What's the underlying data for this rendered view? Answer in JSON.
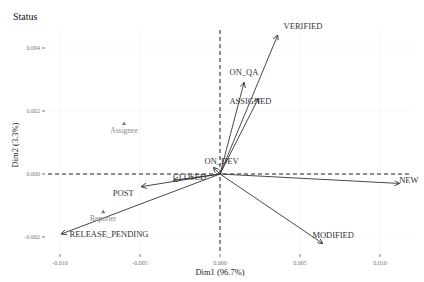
{
  "chart_data": {
    "type": "scatter",
    "subtype": "ca-biplot-arrows",
    "title": "Status",
    "xlabel": "Dim1 (96.7%)",
    "ylabel": "Dim2 (3.3%)",
    "xlim": [
      -0.0115,
      0.0118
    ],
    "ylim": [
      -0.0028,
      0.0048
    ],
    "x_ticks": [
      -0.01,
      -0.005,
      0.0,
      0.005,
      0.01
    ],
    "x_tick_labels": [
      "-0.010",
      "-0.005",
      "0.000",
      "0.005",
      "0.010"
    ],
    "y_ticks": [
      -0.002,
      0.0,
      0.002,
      0.004
    ],
    "y_tick_labels": [
      "-0.002",
      "0.000",
      "0.002",
      "0.004"
    ],
    "grid": true,
    "reference_lines": {
      "x": 0,
      "y": 0,
      "style": "dashed"
    },
    "series": [
      {
        "name": "Status (arrows)",
        "style": "arrow",
        "color": "#333333",
        "points": [
          {
            "label": "VERIFIED",
            "x": 0.0036,
            "y": 0.0044
          },
          {
            "label": "ON_QA",
            "x": 0.0015,
            "y": 0.0029
          },
          {
            "label": "ASSIGNED",
            "x": 0.0024,
            "y": 0.0024
          },
          {
            "label": "ON_DEV",
            "x": -0.0004,
            "y": 0.0002
          },
          {
            "label": "CLOSED",
            "x": -0.0029,
            "y": -0.0002
          },
          {
            "label": "POST",
            "x": -0.0049,
            "y": -0.0004
          },
          {
            "label": "RELEASE_PENDING",
            "x": -0.0099,
            "y": -0.0019
          },
          {
            "label": "NEW",
            "x": 0.0112,
            "y": -0.0003
          },
          {
            "label": "MODIFIED",
            "x": 0.0064,
            "y": -0.0022
          }
        ]
      },
      {
        "name": "Supplementary (triangles)",
        "style": "triangle",
        "color": "#888888",
        "points": [
          {
            "label": "Assignee",
            "x": -0.006,
            "y": 0.0016
          },
          {
            "label": "Reporter",
            "x": -0.0073,
            "y": -0.0012
          }
        ]
      }
    ]
  }
}
